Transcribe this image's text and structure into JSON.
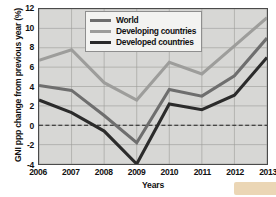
{
  "chart_data": {
    "type": "line",
    "title": "",
    "xlabel": "Years",
    "ylabel": "GNI ppp change from previous year (%)",
    "categories": [
      "2006",
      "2007",
      "2008",
      "2009",
      "2010",
      "2011",
      "2012",
      "2013"
    ],
    "x": [
      2006,
      2007,
      2008,
      2009,
      2010,
      2011,
      2012,
      2013
    ],
    "xlim": [
      2006,
      2013
    ],
    "ylim": [
      -4,
      12
    ],
    "yticks": [
      12,
      10,
      8,
      6,
      4,
      2,
      0,
      -2,
      -4
    ],
    "ytick_labels": [
      "12",
      "10",
      "8",
      "6",
      "4",
      "2",
      "0",
      "-2",
      "-4"
    ],
    "grid": true,
    "zero_line": 0,
    "zero_line_style": "dashed",
    "legend_position": "top-center",
    "plot_background": "#d7d7d5",
    "series": [
      {
        "name": "World",
        "color": "#6e6e6e",
        "values": [
          4.1,
          3.6,
          1.0,
          -1.8,
          3.7,
          3.0,
          5.1,
          9.0
        ]
      },
      {
        "name": "Developing countries",
        "color": "#9d9d9b",
        "values": [
          6.7,
          7.8,
          4.4,
          2.6,
          6.5,
          5.3,
          8.2,
          11.1
        ]
      },
      {
        "name": "Developed countries",
        "color": "#2b2b2b",
        "values": [
          2.6,
          1.3,
          -0.6,
          -4.0,
          2.2,
          1.6,
          3.1,
          7.0
        ]
      }
    ]
  },
  "axes": {
    "y_title": "GNI ppp change from previous year (%)",
    "x_title": "Years"
  },
  "legend": {
    "items": [
      {
        "label": "World",
        "color": "#6e6e6e"
      },
      {
        "label": "Developing countries",
        "color": "#9d9d9b"
      },
      {
        "label": "Developed countries",
        "color": "#2b2b2b"
      }
    ]
  }
}
